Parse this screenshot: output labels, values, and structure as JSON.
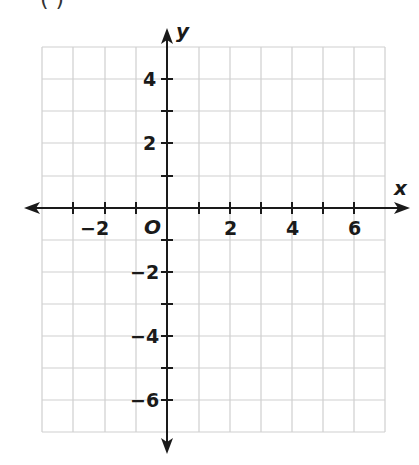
{
  "header": {
    "partial_text": "(     )"
  },
  "graph": {
    "x_axis_label": "x",
    "y_axis_label": "y",
    "origin_label": "O",
    "x_tick_labels": [
      "−2",
      "2",
      "4",
      "6"
    ],
    "y_tick_labels": [
      "4",
      "2",
      "−2",
      "−4",
      "−6"
    ],
    "x_range": [
      -4,
      7
    ],
    "y_range": [
      -7,
      5
    ],
    "grid_color": "#cfcfcf",
    "axis_color": "#1a1a1a"
  }
}
